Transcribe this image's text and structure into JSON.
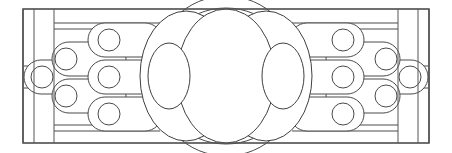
{
  "figure": {
    "width": 452,
    "height": 153,
    "background_color": "#ffffff",
    "stroke_color": "#4a4a4a",
    "frame_stroke_color": "#555555",
    "fill_color": "#ffffff",
    "description": "Mirror-symmetric technical line drawing of nested stadium-shaped links with circular pivots converging on three large overlapping central ellipses, enclosed in a rectangular frame with vertical rails."
  },
  "frame": {
    "name": "outer-frame",
    "x": 23,
    "y": 9,
    "width": 406,
    "height": 134,
    "rails": [
      {
        "name": "rail-left-outer",
        "x": 23
      },
      {
        "name": "rail-left-mid",
        "x": 34
      },
      {
        "name": "rail-left-inner",
        "x": 54
      },
      {
        "name": "rail-right-inner",
        "x": 398
      },
      {
        "name": "rail-right-mid",
        "x": 418
      },
      {
        "name": "rail-right-outer",
        "x": 429
      }
    ]
  },
  "center_ellipses": [
    {
      "name": "center-ellipse-main",
      "cx": 226,
      "cy": 76,
      "rx": 49,
      "ry": 67
    },
    {
      "name": "center-ellipse-left",
      "cx": 186,
      "cy": 76,
      "rx": 46,
      "ry": 65
    },
    {
      "name": "center-ellipse-right",
      "cx": 266,
      "cy": 76,
      "rx": 46,
      "ry": 65
    },
    {
      "name": "inner-ellipse-left",
      "cx": 169,
      "cy": 76,
      "rx": 21,
      "ry": 33
    },
    {
      "name": "inner-ellipse-right",
      "cx": 283,
      "cy": 76,
      "rx": 21,
      "ry": 33
    }
  ],
  "arc_caps": [
    {
      "name": "arc-cap-top",
      "cx": 226,
      "cy": 82,
      "rx": 72,
      "ry": 74
    },
    {
      "name": "arc-cap-bottom",
      "cx": 226,
      "cy": 70,
      "rx": 72,
      "ry": 74
    }
  ],
  "stadium_tiers": {
    "tier_1": {
      "name": "stadium-tier-outer",
      "label": "outer link tier",
      "rows": [
        {
          "name": "stadium-outer-top-left",
          "x": 88,
          "y": 23,
          "w": 74,
          "h": 34,
          "circle_cx": 109,
          "circle_cy": 40,
          "circle_r": 11
        },
        {
          "name": "stadium-outer-mid-left",
          "x": 88,
          "y": 60,
          "w": 74,
          "h": 34,
          "circle_cx": 109,
          "circle_cy": 77,
          "circle_r": 11
        },
        {
          "name": "stadium-outer-bot-left",
          "x": 88,
          "y": 97,
          "w": 74,
          "h": 34,
          "circle_cx": 109,
          "circle_cy": 114,
          "circle_r": 11
        },
        {
          "name": "stadium-outer-top-right",
          "x": 290,
          "y": 23,
          "w": 74,
          "h": 34,
          "circle_cx": 343,
          "circle_cy": 40,
          "circle_r": 11
        },
        {
          "name": "stadium-outer-mid-right",
          "x": 290,
          "y": 60,
          "w": 74,
          "h": 34,
          "circle_cx": 343,
          "circle_cy": 77,
          "circle_r": 11
        },
        {
          "name": "stadium-outer-bot-right",
          "x": 290,
          "y": 97,
          "w": 74,
          "h": 34,
          "circle_cx": 343,
          "circle_cy": 114,
          "circle_r": 11
        }
      ]
    },
    "tier_2": {
      "name": "stadium-tier-middle",
      "label": "middle link tier",
      "rows": [
        {
          "name": "stadium-mid-upper-left",
          "x": 52,
          "y": 42,
          "w": 74,
          "h": 34,
          "circle_cx": 66,
          "circle_cy": 59,
          "circle_r": 11
        },
        {
          "name": "stadium-mid-lower-left",
          "x": 52,
          "y": 79,
          "w": 74,
          "h": 34,
          "circle_cx": 66,
          "circle_cy": 96,
          "circle_r": 11
        },
        {
          "name": "stadium-mid-upper-right",
          "x": 326,
          "y": 42,
          "w": 74,
          "h": 34,
          "circle_cx": 386,
          "circle_cy": 59,
          "circle_r": 11
        },
        {
          "name": "stadium-mid-lower-right",
          "x": 326,
          "y": 79,
          "w": 74,
          "h": 34,
          "circle_cx": 386,
          "circle_cy": 96,
          "circle_r": 11
        }
      ]
    },
    "tier_3": {
      "name": "stadium-tier-inner",
      "label": "inner hub tier",
      "rows": [
        {
          "name": "stadium-inner-left",
          "x": 24,
          "y": 60,
          "w": 74,
          "h": 34,
          "circle_cx": 42,
          "circle_cy": 77,
          "circle_r": 11
        },
        {
          "name": "stadium-inner-right",
          "x": 354,
          "y": 60,
          "w": 74,
          "h": 34,
          "circle_cx": 410,
          "circle_cy": 77,
          "circle_r": 11
        }
      ]
    }
  },
  "connector_lines": {
    "name": "horizontal-connector-lines",
    "left_group": [
      {
        "name": "connector-left-1",
        "y": 29,
        "x1": 54,
        "x2": 160
      },
      {
        "name": "connector-left-2",
        "y": 51,
        "x1": 54,
        "x2": 160
      },
      {
        "name": "connector-left-3",
        "y": 66,
        "x1": 24,
        "x2": 160
      },
      {
        "name": "connector-left-4",
        "y": 88,
        "x1": 24,
        "x2": 160
      },
      {
        "name": "connector-left-5",
        "y": 103,
        "x1": 54,
        "x2": 160
      },
      {
        "name": "connector-left-6",
        "y": 125,
        "x1": 54,
        "x2": 160
      }
    ],
    "right_group": [
      {
        "name": "connector-right-1",
        "y": 29,
        "x1": 292,
        "x2": 398
      },
      {
        "name": "connector-right-2",
        "y": 51,
        "x1": 292,
        "x2": 398
      },
      {
        "name": "connector-right-3",
        "y": 66,
        "x1": 292,
        "x2": 428
      },
      {
        "name": "connector-right-4",
        "y": 88,
        "x1": 292,
        "x2": 428
      },
      {
        "name": "connector-right-5",
        "y": 103,
        "x1": 292,
        "x2": 398
      },
      {
        "name": "connector-right-6",
        "y": 125,
        "x1": 292,
        "x2": 398
      }
    ]
  },
  "frame_bands": {
    "name": "frame-band-lines",
    "top_band_y": 23,
    "bottom_band_y": 131,
    "top_band_segments": [
      {
        "name": "band-top-left",
        "x1": 54,
        "x2": 160
      },
      {
        "name": "band-top-right",
        "x1": 292,
        "x2": 398
      }
    ],
    "bottom_band_segments": [
      {
        "name": "band-bottom-left",
        "x1": 54,
        "x2": 160
      },
      {
        "name": "band-bottom-right",
        "x1": 292,
        "x2": 398
      }
    ]
  }
}
